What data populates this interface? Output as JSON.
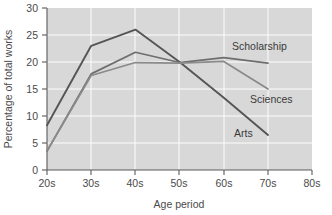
{
  "chart_data": {
    "type": "line",
    "title": "",
    "xlabel": "Age period",
    "ylabel": "Percentage of total works",
    "x": [
      "20s",
      "30s",
      "40s",
      "50s",
      "60s",
      "70s"
    ],
    "xtick_labels": [
      "20s",
      "30s",
      "40s",
      "50s",
      "60s",
      "70s",
      "80s"
    ],
    "ytick_labels": [
      "0",
      "5",
      "10",
      "15",
      "20",
      "25",
      "30"
    ],
    "ylim": [
      0,
      30
    ],
    "ytick_values": [
      0,
      5,
      10,
      15,
      20,
      25,
      30
    ],
    "grid": true,
    "legend_position": "inline-right",
    "series": [
      {
        "name": "Arts",
        "values": [
          8.3,
          23.0,
          26.0,
          20.0,
          13.4,
          6.5
        ],
        "color": "#555555",
        "label_x": "70s",
        "label_text": "Arts"
      },
      {
        "name": "Scholarship",
        "values": [
          3.5,
          17.8,
          21.8,
          19.9,
          20.8,
          19.8
        ],
        "color": "#6e6e6e",
        "label_text": "Scholarship"
      },
      {
        "name": "Sciences",
        "values": [
          3.5,
          17.5,
          19.9,
          19.8,
          20.1,
          15.0
        ],
        "color": "#8a8a8a",
        "label_text": "Sciences"
      }
    ]
  },
  "axes": {
    "y_axis_title": "Percentage of total works",
    "x_axis_title": "Age period"
  },
  "labels": {
    "scholarship": "Scholarship",
    "sciences": "Sciences",
    "arts": "Arts"
  },
  "ticks": {
    "y": [
      "30",
      "25",
      "20",
      "15",
      "10",
      "5",
      "0"
    ],
    "x": [
      "20s",
      "30s",
      "40s",
      "50s",
      "60s",
      "70s",
      "80s"
    ]
  },
  "colors": {
    "plot_background": "#d8d8d8",
    "gridline": "#fdfdfd",
    "axis": "#5a5a5a",
    "arts_line": "#555555",
    "scholarship_line": "#6e6e6e",
    "sciences_line": "#8a8a8a",
    "text": "#4a4a4a"
  }
}
